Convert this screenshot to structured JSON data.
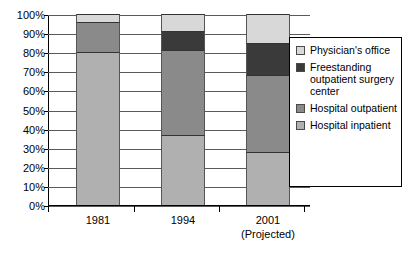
{
  "chart_data": {
    "type": "bar",
    "subtype": "stacked-bar-100-percent",
    "title": "",
    "xlabel": "",
    "ylabel": "",
    "ylim": [
      0,
      100
    ],
    "yticks": [
      "0%",
      "10%",
      "20%",
      "30%",
      "40%",
      "50%",
      "60%",
      "70%",
      "80%",
      "90%",
      "100%"
    ],
    "ytick_values": [
      0,
      10,
      20,
      30,
      40,
      50,
      60,
      70,
      80,
      90,
      100
    ],
    "grid": true,
    "legend_position": "right",
    "categories": [
      "1981",
      "1994",
      "2001"
    ],
    "category_sublabels": [
      "",
      "",
      "(Projected)"
    ],
    "series": [
      {
        "name": "Hospital inpatient",
        "color": "#b0b0b0",
        "values": [
          80,
          36.5,
          28
        ]
      },
      {
        "name": "Hospital outpatient",
        "color": "#8a8a8a",
        "values": [
          16,
          44.5,
          40
        ]
      },
      {
        "name": "Freestanding outpatient surgery center",
        "color": "#3a3a3a",
        "values": [
          0,
          10,
          17
        ]
      },
      {
        "name": "Physician's office",
        "color": "#d8d8d8",
        "values": [
          4,
          9,
          15
        ]
      }
    ]
  },
  "legend": {
    "items": [
      {
        "label": "Physician's office",
        "color": "#d8d8d8"
      },
      {
        "label": "Freestanding outpatient surgery center",
        "color": "#3a3a3a"
      },
      {
        "label": "Hospital outpatient",
        "color": "#8a8a8a"
      },
      {
        "label": "Hospital inpatient",
        "color": "#b0b0b0"
      }
    ]
  }
}
